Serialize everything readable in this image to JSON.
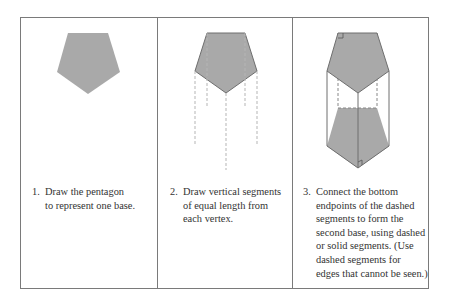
{
  "colors": {
    "fill": "#a9a9a9",
    "stroke": "#6e6e6e",
    "dash": "#b5b5b5",
    "border": "#7a7a7a",
    "text": "#333333"
  },
  "steps": [
    {
      "number": "1.",
      "lines": [
        "Draw the pentagon",
        "to represent one base."
      ]
    },
    {
      "number": "2.",
      "lines": [
        "Draw vertical segments",
        "of equal length from",
        "each vertex."
      ]
    },
    {
      "number": "3.",
      "lines": [
        "Connect the bottom",
        "endpoints of the dashed",
        "segments to form the",
        "second base, using dashed",
        "or solid segments. (Use",
        "dashed segments for",
        "edges that cannot be seen.)"
      ]
    }
  ]
}
